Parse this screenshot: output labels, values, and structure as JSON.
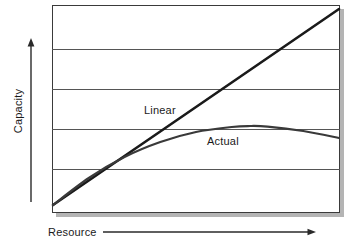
{
  "chart_data": {
    "type": "line",
    "title": "",
    "xlabel": "Resource",
    "ylabel": "Capacity",
    "grid": true,
    "gridlines_y": [
      0.2,
      0.4,
      0.6,
      0.8
    ],
    "xlim": [
      0,
      1
    ],
    "ylim": [
      0,
      1
    ],
    "axis_ticks": "none",
    "legend": "inline-labels",
    "series": [
      {
        "name": "Linear",
        "style": "straight-line",
        "color": "#1a1a1a",
        "width": 2.6,
        "x": [
          0.0,
          0.25,
          0.5,
          0.75,
          1.0
        ],
        "values": [
          0.02,
          0.265,
          0.51,
          0.755,
          1.0
        ]
      },
      {
        "name": "Actual",
        "style": "concave-curve",
        "color": "#3a3a3a",
        "width": 2.2,
        "x": [
          0.0,
          0.125,
          0.25,
          0.375,
          0.5,
          0.625,
          0.69,
          0.75,
          0.875,
          1.0
        ],
        "values": [
          0.02,
          0.155,
          0.26,
          0.335,
          0.385,
          0.41,
          0.415,
          0.412,
          0.39,
          0.355
        ]
      }
    ],
    "annotations": [
      {
        "text": "Linear",
        "x": 0.33,
        "y": 0.545
      },
      {
        "text": "Actual",
        "x": 0.55,
        "y": 0.4
      }
    ]
  },
  "axes": {
    "y": {
      "title": "Capacity",
      "arrow": "arrow-up"
    },
    "x": {
      "title": "Resource",
      "arrow": "arrow-right"
    }
  },
  "series_labels": {
    "linear": "Linear",
    "actual": "Actual"
  },
  "colors": {
    "ink": "#1a1a1a",
    "grid": "#555555",
    "frame": "#3a3a3a",
    "shadow": "#b4b4b4",
    "paper": "#ffffff"
  }
}
